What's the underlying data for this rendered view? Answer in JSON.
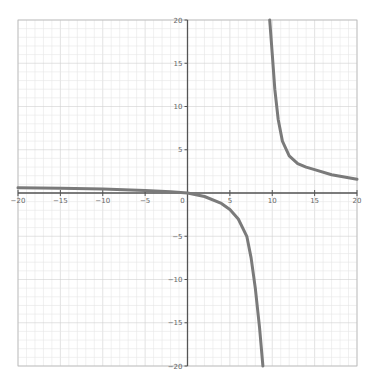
{
  "chart_data": {
    "type": "line",
    "title": "",
    "xlabel": "",
    "ylabel": "",
    "xlim": [
      -20,
      20
    ],
    "ylim": [
      -20,
      20
    ],
    "grid": true,
    "x_ticks": [
      -20,
      -15,
      -10,
      -5,
      0,
      5,
      10,
      15,
      20
    ],
    "y_ticks": [
      -20,
      -15,
      -10,
      -5,
      5,
      10,
      15,
      20
    ],
    "series": [
      {
        "name": "left-branch",
        "x": [
          -20,
          -15,
          -10,
          -5,
          -2,
          0,
          2,
          4,
          5,
          6,
          7,
          7.5,
          8,
          8.5,
          8.9
        ],
        "y": [
          0.6,
          0.55,
          0.45,
          0.3,
          0.15,
          0,
          -0.4,
          -1.2,
          -1.9,
          -3.0,
          -5.0,
          -7.5,
          -11,
          -15.5,
          -20
        ]
      },
      {
        "name": "right-branch",
        "x": [
          9.7,
          10,
          10.3,
          10.7,
          11.2,
          12,
          13,
          14,
          15,
          17,
          20
        ],
        "y": [
          20,
          16,
          12,
          8.5,
          6,
          4.3,
          3.4,
          3.0,
          2.7,
          2.1,
          1.6
        ]
      }
    ],
    "colors": {
      "curve": "#7a7a7a",
      "axis": "#555555",
      "grid_minor": "#e6e6e6",
      "grid_major": "#d0d0d0"
    }
  }
}
